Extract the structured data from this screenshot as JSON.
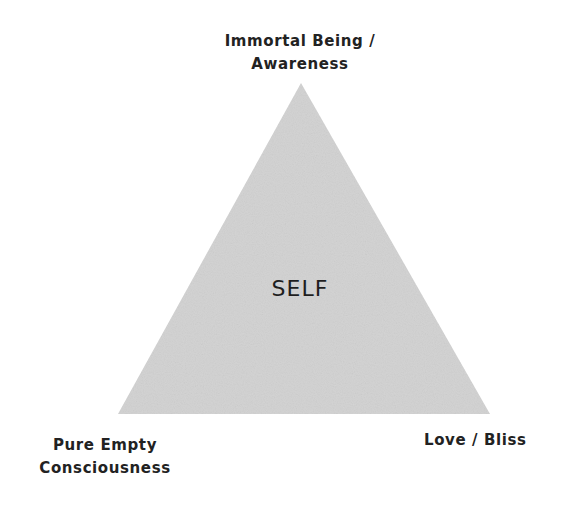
{
  "diagram": {
    "title": "SELF",
    "shape": "triangle",
    "fill_color": "#d4d4d4",
    "vertices": {
      "top": {
        "x": 301,
        "y": 83
      },
      "bottom_left": {
        "x": 118,
        "y": 414
      },
      "bottom_right": {
        "x": 490,
        "y": 414
      }
    },
    "labels": {
      "top": {
        "line1": "Immortal Being /",
        "line2": "Awareness"
      },
      "bottom_left": {
        "line1": "Pure Empty",
        "line2": "Consciousness"
      },
      "bottom_right": {
        "line1": "Love / Bliss"
      },
      "center": "SELF"
    }
  }
}
